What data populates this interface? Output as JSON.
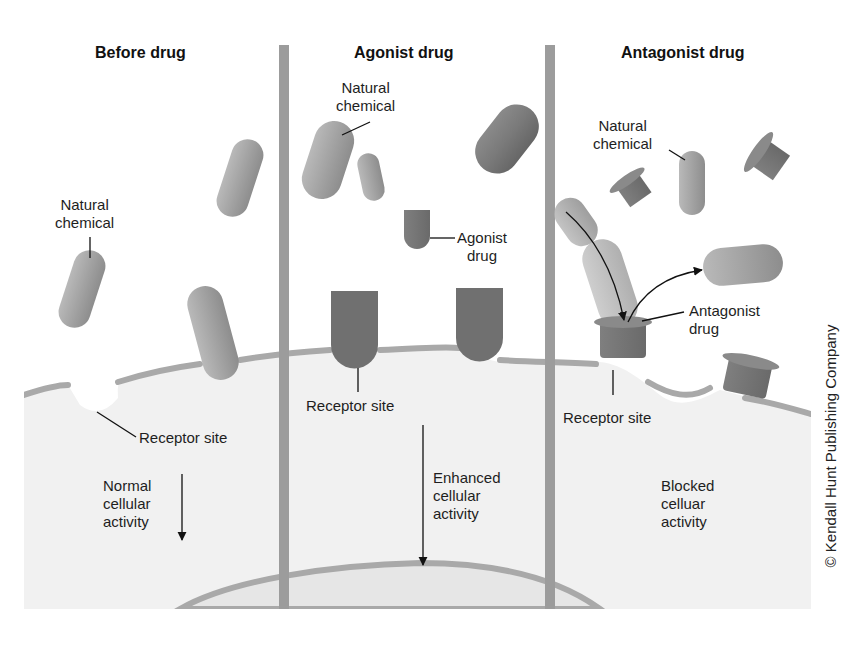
{
  "figure": {
    "panels": [
      {
        "id": "before",
        "title": "Before drug",
        "labels": {
          "natural_chemical": [
            "Natural",
            "chemical"
          ],
          "receptor_site": "Receptor site",
          "activity": [
            "Normal",
            "cellular",
            "activity"
          ]
        }
      },
      {
        "id": "agonist",
        "title": "Agonist drug",
        "labels": {
          "natural_chemical": [
            "Natural",
            "chemical"
          ],
          "agonist_drug": [
            "Agonist",
            "drug"
          ],
          "receptor_site": "Receptor site",
          "activity": [
            "Enhanced",
            "cellular",
            "activity"
          ]
        }
      },
      {
        "id": "antagonist",
        "title": "Antagonist drug",
        "labels": {
          "natural_chemical": [
            "Natural",
            "chemical"
          ],
          "antagonist_drug": [
            "Antagonist",
            "drug"
          ],
          "receptor_site": "Receptor site",
          "activity": [
            "Blocked",
            "celluar",
            "activity"
          ]
        }
      }
    ],
    "copyright": "© Kendall Hunt Publishing Company",
    "colors": {
      "background": "#ffffff",
      "cell_fill": "#f1f1f1",
      "membrane": "#a9a9a9",
      "divider": "#9c9c9c",
      "natural_chemical": "#a8a8a8",
      "drug_dark": "#7a7a7a",
      "receptor_dark": "#707070",
      "nucleus_fill": "#e6e6e6"
    }
  }
}
